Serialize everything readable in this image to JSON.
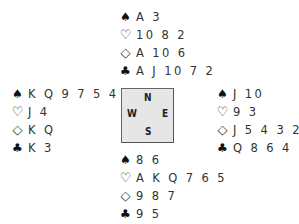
{
  "suit_symbols": {
    "spades": "♠",
    "hearts": "♡",
    "diamonds": "◇",
    "clubs": "♣"
  },
  "compass": {
    "north": "N",
    "south": "S",
    "west": "W",
    "east": "E"
  },
  "hands": {
    "north": {
      "spades": "A 3",
      "hearts": "10 8 2",
      "diamonds": "A 10 6",
      "clubs": "A J 10 7 2"
    },
    "west": {
      "spades": "K Q 9 7 5 4 2",
      "hearts": "J 4",
      "diamonds": "K Q",
      "clubs": "K 3"
    },
    "east": {
      "spades": "J 10",
      "hearts": "9 3",
      "diamonds": "J 5 4 3 2",
      "clubs": "Q 8 6 4"
    },
    "south": {
      "spades": "8 6",
      "hearts": "A K Q 7 6 5",
      "diamonds": "9 8 7",
      "clubs": "9 5"
    }
  }
}
